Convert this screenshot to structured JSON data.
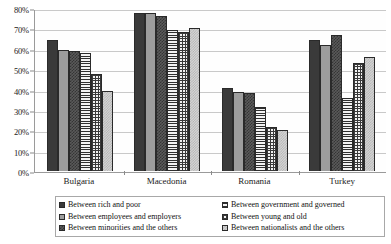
{
  "chart_data": {
    "type": "bar",
    "title": "",
    "xlabel": "",
    "ylabel": "",
    "ylim": [
      0,
      80
    ],
    "grid": true,
    "legend_position": "bottom",
    "categories": [
      "Bulgaria",
      "Macedonia",
      "Romania",
      "Turkey"
    ],
    "ytick_labels": [
      "0%",
      "10%",
      "20%",
      "30%",
      "40%",
      "50%",
      "60%",
      "70%",
      "80%"
    ],
    "ytick_values": [
      0,
      10,
      20,
      30,
      40,
      50,
      60,
      70,
      80
    ],
    "series": [
      {
        "name": "Between rich and poor",
        "pattern": "solid-dark",
        "color": "#3a3a3a",
        "values": [
          64.5,
          78.0,
          41.0,
          64.5
        ]
      },
      {
        "name": "Between employees and employers",
        "pattern": "solid-gray",
        "color": "#9d9d9d",
        "values": [
          60.0,
          78.0,
          39.0,
          62.0
        ]
      },
      {
        "name": "Between minorities and the others",
        "pattern": "checker-dark",
        "color": "#5a5a5a",
        "values": [
          59.5,
          76.5,
          38.5,
          67.0
        ]
      },
      {
        "name": "Between government and governed",
        "pattern": "horizontal-lines",
        "color": "#2f2f2f",
        "values": [
          58.5,
          69.5,
          31.5,
          36.0
        ]
      },
      {
        "name": "Between young and old",
        "pattern": "cross-hatch",
        "color": "#3a3a3a",
        "values": [
          48.0,
          68.5,
          21.5,
          53.5
        ]
      },
      {
        "name": "Between nationalists and the others",
        "pattern": "checker-light",
        "color": "#d5d5d5",
        "values": [
          39.5,
          70.5,
          20.5,
          56.5
        ]
      }
    ]
  }
}
